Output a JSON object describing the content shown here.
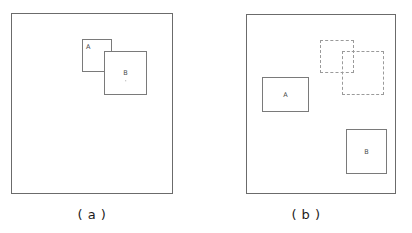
{
  "figure": {
    "type": "diagram",
    "background_color": "#ffffff",
    "line_color": "#6b6b6b",
    "ghost_line_color": "#9a9a9a",
    "label_color": "#4a4a4a",
    "caption_color": "#1c1c1c"
  },
  "panels": [
    {
      "id": "a",
      "caption": "( a )",
      "frame": {
        "x": 11,
        "y": 13,
        "width": 162,
        "height": 181,
        "style": "solid"
      },
      "objects": [
        {
          "name": "box-a",
          "label": "A",
          "label_position": "top-left",
          "style": "solid",
          "x": 81,
          "y": 38,
          "width": 30,
          "height": 33,
          "z": 1
        },
        {
          "name": "box-b",
          "label": "B",
          "label_position": "center",
          "style": "solid",
          "x": 103,
          "y": 50,
          "width": 43,
          "height": 44,
          "z": 2,
          "has_dot_mark": true
        }
      ]
    },
    {
      "id": "b",
      "caption": "( b )",
      "frame": {
        "x": 246,
        "y": 14,
        "width": 150,
        "height": 180,
        "style": "solid"
      },
      "objects": [
        {
          "name": "box-a",
          "label": "A",
          "label_position": "center",
          "style": "solid",
          "x": 261,
          "y": 76,
          "width": 47,
          "height": 35,
          "z": 1
        },
        {
          "name": "box-b",
          "label": "B",
          "label_position": "center",
          "style": "solid",
          "x": 345,
          "y": 128,
          "width": 41,
          "height": 45,
          "z": 1
        },
        {
          "name": "ghost-box-a",
          "label": "",
          "label_position": "none",
          "style": "dashed",
          "x": 319,
          "y": 39,
          "width": 34,
          "height": 33,
          "z": 0
        },
        {
          "name": "ghost-box-b",
          "label": "",
          "label_position": "none",
          "style": "dashed",
          "x": 341,
          "y": 50,
          "width": 42,
          "height": 44,
          "z": 0
        }
      ]
    }
  ],
  "labels": {
    "a": "A",
    "b": "B"
  },
  "captions": {
    "panel_a": "( a )",
    "panel_b": "( b )"
  }
}
